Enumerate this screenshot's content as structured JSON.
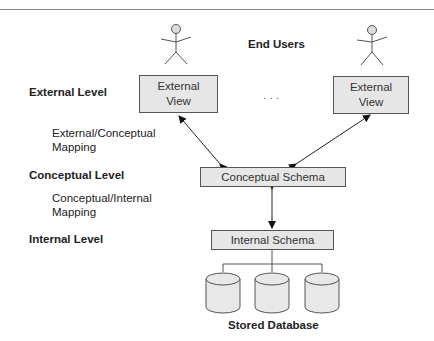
{
  "diagram": {
    "end_users_label": "End Users",
    "ellipsis": ". . .",
    "levels": {
      "external": "External Level",
      "external_conceptual_mapping": [
        "External/Conceptual",
        "Mapping"
      ],
      "conceptual": "Conceptual Level",
      "conceptual_internal_mapping": [
        "Conceptual/Internal",
        "Mapping"
      ],
      "internal": "Internal Level"
    },
    "nodes": {
      "external_view_left": [
        "External",
        "View"
      ],
      "external_view_right": [
        "External",
        "View"
      ],
      "conceptual_schema": "Conceptual Schema",
      "internal_schema": "Internal Schema",
      "stored_database": "Stored Database"
    },
    "edges": [
      {
        "from": "external_view_left",
        "to": "conceptual_schema",
        "type": "bidirectional-arrow"
      },
      {
        "from": "external_view_right",
        "to": "conceptual_schema",
        "type": "bidirectional-arrow"
      },
      {
        "from": "conceptual_schema",
        "to": "internal_schema",
        "type": "bidirectional-arrow"
      },
      {
        "from": "internal_schema",
        "to": "stored_database",
        "type": "line"
      }
    ],
    "colors": {
      "box_fill": "#e6e6e6",
      "box_border": "#555555",
      "line": "#222222",
      "cylinder_fill": "#e8e8e8"
    }
  }
}
